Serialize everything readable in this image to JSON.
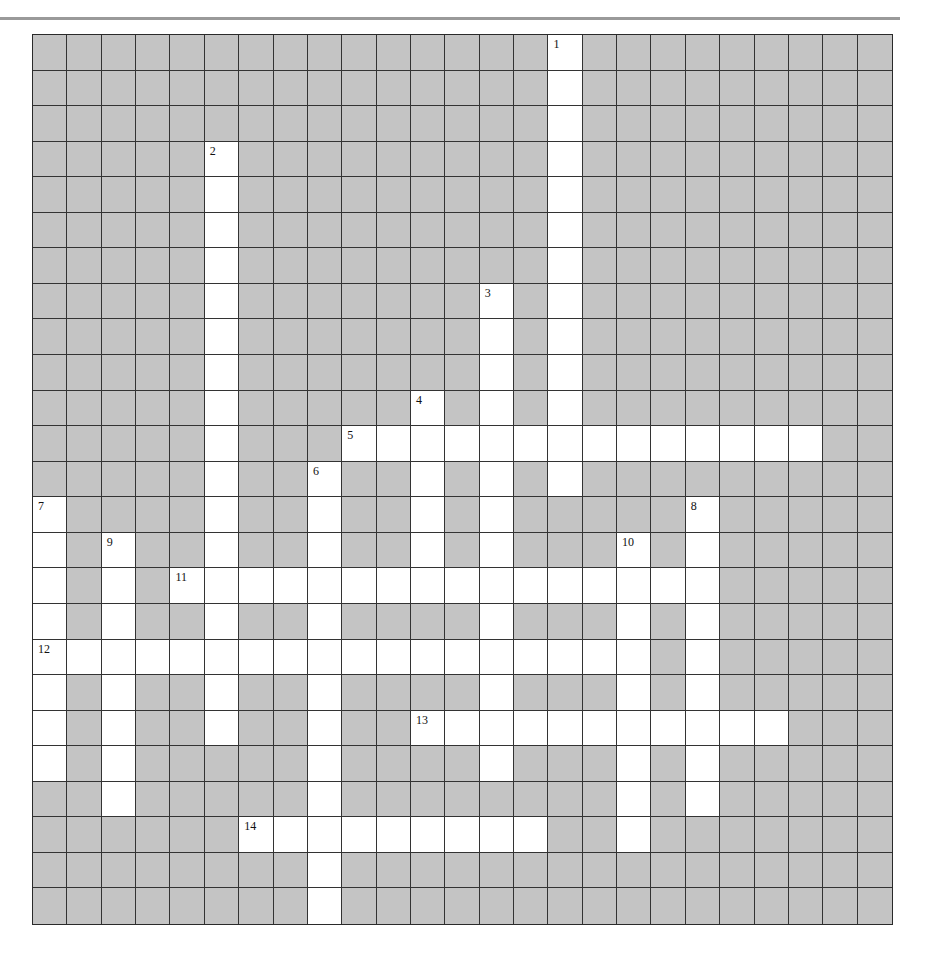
{
  "puzzle": {
    "rows": 25,
    "cols": 25,
    "colors": {
      "block": "#c4c4c4",
      "open": "#ffffff",
      "line": "#333333",
      "rule": "#9a9a9a"
    },
    "entries": [
      {
        "number": "1",
        "direction": "down",
        "row": 0,
        "col": 15,
        "length": 13
      },
      {
        "number": "2",
        "direction": "down",
        "row": 3,
        "col": 5,
        "length": 17
      },
      {
        "number": "3",
        "direction": "down",
        "row": 7,
        "col": 13,
        "length": 14
      },
      {
        "number": "4",
        "direction": "down",
        "row": 10,
        "col": 11,
        "length": 6
      },
      {
        "number": "5",
        "direction": "across",
        "row": 11,
        "col": 9,
        "length": 14
      },
      {
        "number": "6",
        "direction": "down",
        "row": 12,
        "col": 8,
        "length": 13
      },
      {
        "number": "7",
        "direction": "down",
        "row": 13,
        "col": 0,
        "length": 8
      },
      {
        "number": "8",
        "direction": "down",
        "row": 13,
        "col": 19,
        "length": 9
      },
      {
        "number": "9",
        "direction": "down",
        "row": 14,
        "col": 2,
        "length": 8
      },
      {
        "number": "10",
        "direction": "down",
        "row": 14,
        "col": 17,
        "length": 9
      },
      {
        "number": "11",
        "direction": "across",
        "row": 15,
        "col": 4,
        "length": 16
      },
      {
        "number": "12",
        "direction": "across",
        "row": 17,
        "col": 0,
        "length": 18
      },
      {
        "number": "13",
        "direction": "across",
        "row": 19,
        "col": 11,
        "length": 11
      },
      {
        "number": "14",
        "direction": "across",
        "row": 22,
        "col": 6,
        "length": 9
      }
    ]
  }
}
